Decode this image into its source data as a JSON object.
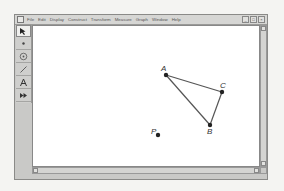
{
  "menubar": {
    "items": [
      "File",
      "Edit",
      "Display",
      "Construct",
      "Transform",
      "Measure",
      "Graph",
      "Window",
      "Help"
    ],
    "window_controls": [
      "_",
      "□",
      "×"
    ]
  },
  "toolbox": {
    "tools": [
      {
        "name": "arrow-selection-tool",
        "glyph": "↖",
        "active": true
      },
      {
        "name": "point-tool",
        "glyph": "•"
      },
      {
        "name": "compass-tool",
        "glyph": "◎"
      },
      {
        "name": "straightedge-tool",
        "glyph": "∕"
      },
      {
        "name": "text-tool",
        "glyph": "A"
      },
      {
        "name": "custom-tool",
        "glyph": "▶▶"
      }
    ]
  },
  "canvas": {
    "points": [
      {
        "label": "A",
        "x": 134,
        "y": 50
      },
      {
        "label": "C",
        "x": 190,
        "y": 67
      },
      {
        "label": "B",
        "x": 178,
        "y": 100
      },
      {
        "label": "P",
        "x": 126,
        "y": 110
      }
    ],
    "segments": [
      [
        "A",
        "C"
      ],
      [
        "C",
        "B"
      ],
      [
        "B",
        "A"
      ]
    ],
    "colors": {
      "stroke": "#555555",
      "point": "#222222",
      "label": "#333333"
    }
  }
}
